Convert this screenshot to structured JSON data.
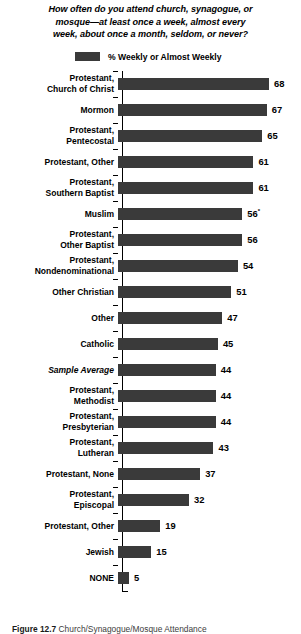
{
  "title": {
    "line1": "How often do you attend church, synagogue, or",
    "line2": "mosque—at least once a week, almost every",
    "line3": "week, about once a month, seldom, or never?"
  },
  "legend": {
    "label": "% Weekly or Almost Weekly",
    "color": "#3a3a3a"
  },
  "caption": {
    "figure_number": "Figure 12.7",
    "text": "Church/Synagogue/Mosque Attendance"
  },
  "chart_data": {
    "type": "bar",
    "orientation": "horizontal",
    "title": "How often do you attend church, synagogue, or mosque—at least once a week, almost every week, about once a month, seldom, or never?",
    "series_name": "% Weekly or Almost Weekly",
    "xlabel": "",
    "ylabel": "",
    "xlim": [
      0,
      70
    ],
    "grid": false,
    "legend_position": "top",
    "bar_color": "#3a3a3a",
    "categories": [
      "Protestant,\nChurch of Christ",
      "Mormon",
      "Protestant,\nPentecostal",
      "Protestant, Other",
      "Protestant,\nSouthern Baptist",
      "Muslim",
      "Protestant,\nOther Baptist",
      "Protestant,\nNondenominational",
      "Other Christian",
      "Other",
      "Catholic",
      "Sample Average",
      "Protestant,\nMethodist",
      "Protestant,\nPresbyterian",
      "Protestant,\nLutheran",
      "Protestant, None",
      "Protestant,\nEpiscopal",
      "Protestant, Other",
      "Jewish",
      "NONE"
    ],
    "values": [
      68,
      67,
      65,
      61,
      61,
      56,
      56,
      54,
      51,
      47,
      45,
      44,
      44,
      44,
      43,
      37,
      32,
      19,
      15,
      5
    ],
    "value_labels": [
      "68",
      "67",
      "65",
      "61",
      "61",
      "56",
      "56",
      "54",
      "51",
      "47",
      "45",
      "44",
      "44",
      "44",
      "43",
      "37",
      "32",
      "19",
      "15",
      "5"
    ],
    "footnote_markers": {
      "5": "*"
    },
    "italic_categories": [
      "Sample Average"
    ]
  }
}
